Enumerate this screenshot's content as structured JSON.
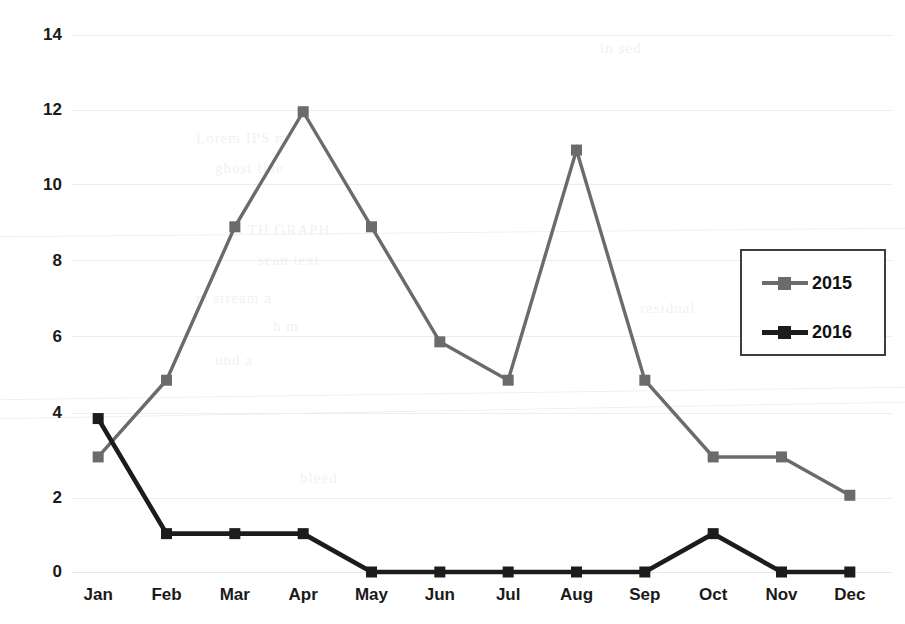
{
  "chart_data": {
    "type": "line",
    "title": "",
    "subtitle": "",
    "xlabel": "",
    "ylabel": "",
    "categories": [
      "Jan",
      "Feb",
      "Mar",
      "Apr",
      "May",
      "Jun",
      "Jul",
      "Aug",
      "Sep",
      "Oct",
      "Nov",
      "Dec"
    ],
    "series": [
      {
        "name": "2015",
        "color": "#6b6b6b",
        "marker": "square",
        "values": [
          3,
          5,
          9,
          12,
          9,
          6,
          5,
          11,
          5,
          3,
          3,
          2
        ]
      },
      {
        "name": "2016",
        "color": "#1c1c1c",
        "marker": "square",
        "values": [
          4,
          1,
          1,
          1,
          0,
          0,
          0,
          0,
          0,
          1,
          0,
          0
        ]
      }
    ],
    "ylim": [
      0,
      14
    ],
    "ytick_step": 2,
    "yticks": [
      0,
      2,
      4,
      6,
      8,
      10,
      12,
      14
    ],
    "ytick_labels": [
      "0",
      "2",
      "4",
      "6",
      "8",
      "10",
      "12",
      "14"
    ],
    "xlim_categories": 12,
    "grid": {
      "horizontal": true,
      "vertical": false,
      "color": "#ededed"
    },
    "legend": {
      "position": "right-middle",
      "border": true,
      "entries": [
        "2015",
        "2016"
      ]
    },
    "background": "#ffffff",
    "axis_text_color": "#1a1a1a"
  },
  "artifacts": {
    "ghost_notes": [
      "Lorem IPS m",
      "ghost line",
      "S TH GRAPH",
      "scan text",
      "m stream a",
      "h m",
      "und a",
      "in  sed",
      "residual",
      "bleed"
    ]
  }
}
